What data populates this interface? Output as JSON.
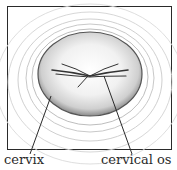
{
  "figure": {
    "labels": {
      "cervix": "cervix",
      "cervical_os": "cervical os"
    }
  }
}
